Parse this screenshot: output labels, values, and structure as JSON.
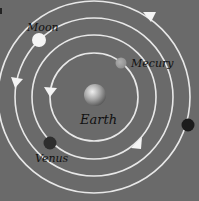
{
  "diagram": {
    "background": "#6a6a6a",
    "center": {
      "x": 94,
      "y": 97
    },
    "orbits": [
      {
        "radius": 44
      },
      {
        "radius": 62
      },
      {
        "radius": 79
      },
      {
        "radius": 96
      }
    ],
    "bodies": [
      {
        "name": "Earth",
        "label": "Earth",
        "x": 95,
        "y": 95,
        "r": 11,
        "color": "#b8b8b8"
      },
      {
        "name": "Moon",
        "label": "Moon",
        "x": 39,
        "y": 40,
        "r": 7,
        "color": "#f4f4f4"
      },
      {
        "name": "Mercury",
        "label": "Mecury",
        "x": 121,
        "y": 63,
        "r": 5.5,
        "color": "#9a9a9a"
      },
      {
        "name": "Venus",
        "label": "Venus",
        "x": 50,
        "y": 143,
        "r": 6.5,
        "color": "#2e2e2e"
      },
      {
        "name": "Outer planet",
        "label": "",
        "x": 188,
        "y": 125,
        "r": 6.5,
        "color": "#1e1e1e"
      }
    ],
    "labels": {
      "moon": "Moon",
      "mercury": "Mecury",
      "earth": "Earth",
      "venus": "Venus"
    },
    "arrows": [
      {
        "orbit": 4,
        "x": 149,
        "y": 17,
        "direction": "down-right"
      },
      {
        "orbit": 3,
        "x": 17,
        "y": 82,
        "direction": "down"
      },
      {
        "orbit": 1,
        "x": 50,
        "y": 92,
        "direction": "down"
      },
      {
        "orbit": 2,
        "x": 136,
        "y": 143,
        "direction": "up-right"
      }
    ]
  }
}
